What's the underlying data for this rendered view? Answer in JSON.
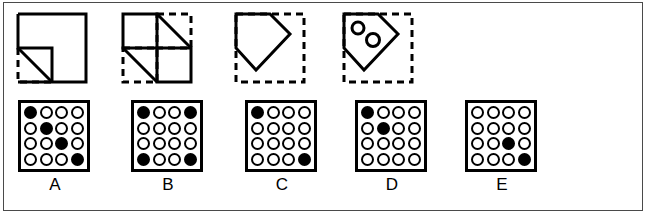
{
  "puzzle": {
    "figures": [
      {
        "id": "figure-1",
        "name": "square-with-cut-corner",
        "description": "Square outline with bottom-left corner removed, dashed square region at bottom-left with diagonal line"
      },
      {
        "id": "figure-2",
        "name": "quadrant-square-with-diagonals",
        "description": "Square divided into four quadrants, dashed boxes at top-right and bottom-left, diagonals drawn across them"
      },
      {
        "id": "figure-3",
        "name": "pentagon-in-dashed-square",
        "description": "Pentagon pointing right drawn with solid lines inside a dashed square"
      },
      {
        "id": "figure-4",
        "name": "pentagon-with-two-circles",
        "description": "Pentagon pointing right containing two small circles, inside a dashed square"
      }
    ],
    "options": [
      {
        "label": "A",
        "name": "option-a",
        "filled": [
          [
            true,
            false,
            false,
            false
          ],
          [
            false,
            true,
            false,
            false
          ],
          [
            false,
            false,
            true,
            false
          ],
          [
            false,
            false,
            false,
            true
          ]
        ]
      },
      {
        "label": "B",
        "name": "option-b",
        "filled": [
          [
            true,
            false,
            false,
            true
          ],
          [
            false,
            false,
            false,
            false
          ],
          [
            false,
            false,
            false,
            false
          ],
          [
            true,
            false,
            false,
            true
          ]
        ]
      },
      {
        "label": "C",
        "name": "option-c",
        "filled": [
          [
            true,
            false,
            false,
            false
          ],
          [
            false,
            false,
            false,
            false
          ],
          [
            false,
            false,
            false,
            false
          ],
          [
            false,
            false,
            false,
            true
          ]
        ]
      },
      {
        "label": "D",
        "name": "option-d",
        "filled": [
          [
            true,
            false,
            false,
            false
          ],
          [
            false,
            true,
            false,
            false
          ],
          [
            false,
            false,
            false,
            false
          ],
          [
            false,
            false,
            false,
            false
          ]
        ]
      },
      {
        "label": "E",
        "name": "option-e",
        "filled": [
          [
            false,
            false,
            false,
            false
          ],
          [
            false,
            false,
            false,
            false
          ],
          [
            false,
            false,
            true,
            false
          ],
          [
            false,
            false,
            false,
            true
          ]
        ]
      }
    ],
    "colors": {
      "ink": "#000000",
      "frame": "#4a4a4a",
      "background": "#ffffff"
    }
  }
}
